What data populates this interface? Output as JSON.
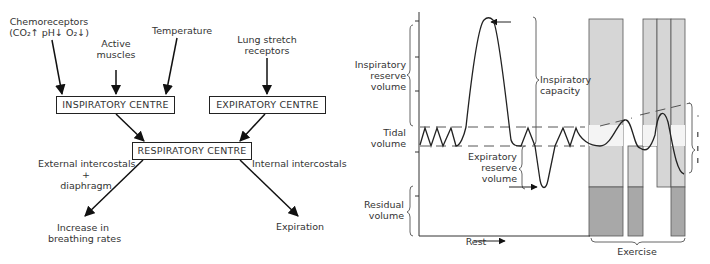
{
  "flowchart": {
    "inputs": {
      "chemoreceptors": {
        "line1": "Chemoreceptors",
        "line2": "(CO₂↑ pH↓ O₂↓)"
      },
      "active_muscles": {
        "line1": "Active",
        "line2": "muscles"
      },
      "temperature": "Temperature",
      "lung_stretch": {
        "line1": "Lung stretch",
        "line2": "receptors"
      }
    },
    "boxes": {
      "inspiratory": "INSPIRATORY CENTRE",
      "expiratory": "EXPIRATORY CENTRE",
      "respiratory": "RESPIRATORY CENTRE"
    },
    "left_branch": {
      "effector_line1": "External intercostals",
      "effector_line2": "+",
      "effector_line3": "diaphragm",
      "outcome_line1": "Increase in",
      "outcome_line2": "breathing rates"
    },
    "right_branch": {
      "effector": "Internal intercostals",
      "outcome": "Expiration"
    }
  },
  "spirogram": {
    "labels": {
      "irv": {
        "line1": "Inspiratory",
        "line2": "reserve",
        "line3": "volume"
      },
      "tidal": {
        "line1": "Tidal",
        "line2": "volume"
      },
      "residual": {
        "line1": "Residual",
        "line2": "volume"
      },
      "ic": {
        "line1": "Inspiratory",
        "line2": "capacity"
      },
      "erv": {
        "line1": "Expiratory",
        "line2": "reserve",
        "line3": "volume"
      },
      "rest": "Rest",
      "exercise": "Exercise"
    },
    "colors": {
      "light_bar": "#d4d4d4",
      "dark_bar": "#a6a6a6",
      "line": "#222222"
    }
  }
}
